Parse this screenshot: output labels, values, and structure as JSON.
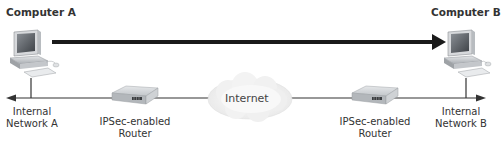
{
  "diagram": {
    "nodes": {
      "computer_a": {
        "label": "Computer A",
        "icon": "desktop-computer-icon"
      },
      "computer_b": {
        "label": "Computer B",
        "icon": "desktop-computer-icon"
      },
      "router_a": {
        "label_line1": "IPSec-enabled",
        "label_line2": "Router",
        "icon": "router-icon"
      },
      "router_b": {
        "label_line1": "IPSec-enabled",
        "label_line2": "Router",
        "icon": "router-icon"
      },
      "internet": {
        "label": "Internet",
        "icon": "cloud-icon"
      },
      "network_a": {
        "label_line1": "Internal",
        "label_line2": "Network A"
      },
      "network_b": {
        "label_line1": "Internal",
        "label_line2": "Network B"
      }
    },
    "edges": [
      {
        "from": "computer_a",
        "to": "computer_b",
        "style": "thick-arrow"
      },
      {
        "from": "network_a",
        "to": "network_b",
        "style": "thin-line-arrows-both-ends",
        "via": [
          "router_a",
          "internet",
          "router_b"
        ]
      }
    ],
    "colors": {
      "thick_arrow": "#1a1a1a",
      "network_line": "#333333",
      "cloud": "#eeeeee",
      "router_body": "#c9cccf"
    }
  }
}
